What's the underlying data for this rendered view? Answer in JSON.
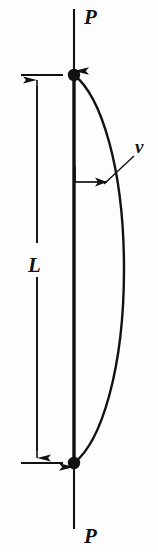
{
  "figure": {
    "name": "pin-ended-column-buckling-diagram",
    "background_color": "#fdfdfd",
    "ink_color": "#111111",
    "width": 158,
    "height": 552
  },
  "labels": {
    "load_top": "P",
    "load_bottom": "P",
    "length": "L",
    "deflection": "v"
  },
  "icons": {
    "force_arrow_top": "arrow-down-icon",
    "force_arrow_bottom": "arrow-up-icon",
    "dimension_arrow_top": "arrow-up-icon",
    "dimension_arrow_bottom": "arrow-down-icon",
    "deflection_arrow": "arrow-right-icon",
    "pin_top": "pin-support-node",
    "pin_bottom": "pin-support-node"
  },
  "geometry": {
    "column_x": 74,
    "node_top_y": 75,
    "node_bottom_y": 463,
    "node_radius": 6,
    "curve_max_x": 124,
    "dimension_line_x": 37,
    "extension_tick_left": 21,
    "extension_tick_right": 63,
    "deflection_arrow_y": 182,
    "deflection_arrow_x_end": 106
  }
}
